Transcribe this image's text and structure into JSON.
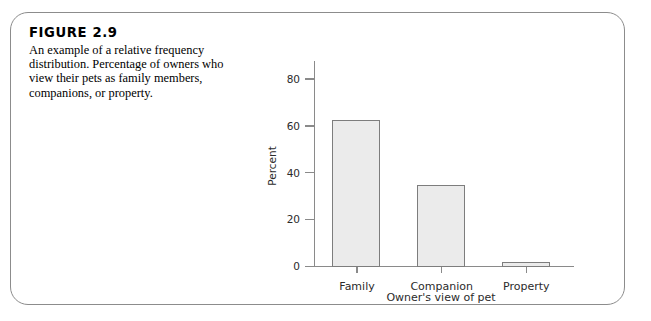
{
  "figure": {
    "title": "FIGURE 2.9",
    "caption": "An example of a relative frequency distribution. Percentage of owners who view their pets as family members, companions, or property."
  },
  "colors": {
    "bar_fill": "#ebebeb",
    "bar_stroke": "#7d7d7d",
    "axis": "#8a8a8a",
    "card_border": "#8c8c8c",
    "text": "#000000"
  },
  "chart_data": {
    "type": "bar",
    "title": "",
    "categories": [
      "Family",
      "Companion",
      "Property"
    ],
    "values": [
      63,
      35,
      2
    ],
    "xlabel": "Owner's view of pet",
    "ylabel": "Percent",
    "ylim": [
      0,
      88
    ],
    "yticks": [
      0,
      20,
      40,
      60,
      80
    ],
    "ytick_labels": [
      "0",
      "20",
      "40",
      "60",
      "80"
    ],
    "grid": false,
    "legend": false
  }
}
